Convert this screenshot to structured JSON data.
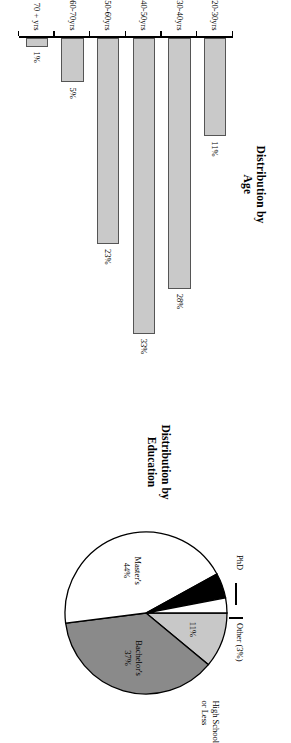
{
  "figure": {
    "orientation_note": "rotated-90"
  },
  "bar_chart": {
    "title_line1": "Distribution by",
    "title_line2": "Age",
    "categories": [
      "20-30yrs",
      "30-40yrs",
      "40-50yrs",
      "50-60yrs",
      "60-70yrs",
      "70 + yrs"
    ],
    "values": [
      11,
      28,
      33,
      23,
      5,
      1
    ],
    "value_labels": [
      "11%",
      "28%",
      "33%",
      "23%",
      "5%",
      "1%"
    ],
    "bar_fill": "#c9c9c9",
    "bar_stroke": "#555555"
  },
  "pie_chart": {
    "title_line1": "Distribution by",
    "title_line2": "Education",
    "slices": [
      {
        "name": "High School or Less",
        "label_line1": "High School",
        "label_line2": "or Less",
        "value": 11,
        "value_label": "11%",
        "color": "#c8c8c8"
      },
      {
        "name": "Bachelor's",
        "label_line1": "Bachelor's",
        "label_line2": "",
        "value": 37,
        "value_label": "37%",
        "color": "#8a8a8a"
      },
      {
        "name": "Master's",
        "label_line1": "Master's",
        "label_line2": "",
        "value": 44,
        "value_label": "44%",
        "color": "#ffffff"
      },
      {
        "name": "PhD",
        "label_line1": "PhD",
        "label_line2": "",
        "value": 5,
        "value_label": "5%",
        "color": "#000000"
      },
      {
        "name": "Other",
        "label_line1": "Other (3%)",
        "label_line2": "",
        "value": 3,
        "value_label": "",
        "color": "#ffffff"
      }
    ]
  },
  "chart_data": [
    {
      "type": "bar",
      "title": "Distribution by Age",
      "orientation": "horizontal",
      "categories": [
        "20-30yrs",
        "30-40yrs",
        "40-50yrs",
        "50-60yrs",
        "60-70yrs",
        "70 + yrs"
      ],
      "values": [
        11,
        28,
        33,
        23,
        5,
        1
      ],
      "data_labels": [
        "11%",
        "28%",
        "33%",
        "23%",
        "5%",
        "1%"
      ],
      "xlabel": "",
      "ylabel": "",
      "xlim": [
        0,
        35
      ],
      "grid": false,
      "legend": "none",
      "series": [
        {
          "name": "Percent of respondents",
          "values": [
            11,
            28,
            33,
            23,
            5,
            1
          ]
        }
      ]
    },
    {
      "type": "pie",
      "title": "Distribution by Education",
      "categories": [
        "High School or Less",
        "Bachelor's",
        "Master's",
        "PhD",
        "Other"
      ],
      "values": [
        11,
        37,
        44,
        5,
        3
      ],
      "data_labels": [
        "11%",
        "37%",
        "44%",
        "5%",
        "(3%)"
      ],
      "colors": [
        "#c8c8c8",
        "#8a8a8a",
        "#ffffff",
        "#000000",
        "#ffffff"
      ],
      "legend": "none",
      "annotations": [
        "High School or Less",
        "Bachelor's",
        "Master's",
        "PhD",
        "Other (3%)"
      ]
    }
  ]
}
